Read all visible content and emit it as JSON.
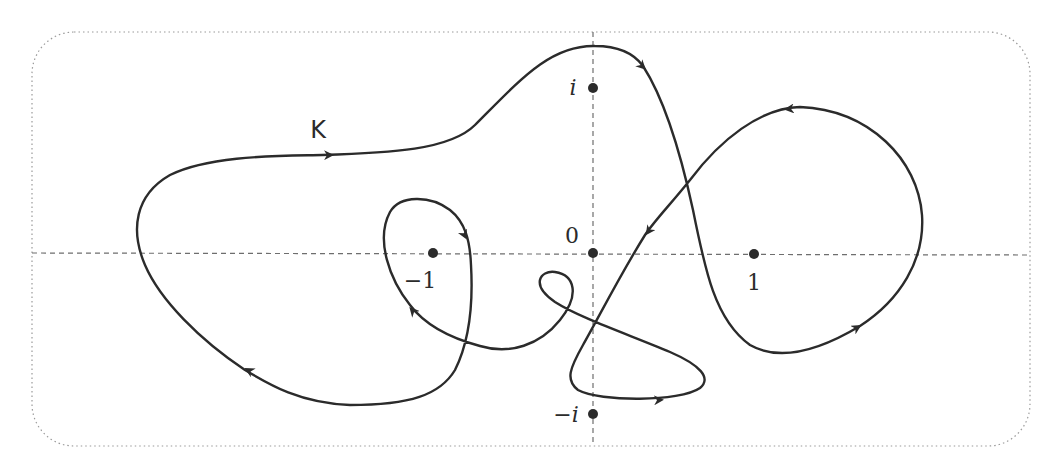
{
  "figure": {
    "curve_label": "K",
    "points": [
      {
        "name": "origin",
        "label": "0",
        "x": 593,
        "y": 253,
        "label_x": 572,
        "label_y": 243
      },
      {
        "name": "minus-one",
        "label": "−1",
        "x": 433,
        "y": 253,
        "label_x": 420,
        "label_y": 288
      },
      {
        "name": "one",
        "label": "1",
        "x": 754,
        "y": 254,
        "label_x": 754,
        "label_y": 290
      },
      {
        "name": "i",
        "label": "i",
        "x": 593,
        "y": 88,
        "label_x": 573,
        "label_y": 95
      },
      {
        "name": "minus-i",
        "label": "−i",
        "x": 593,
        "y": 414,
        "label_x": 566,
        "label_y": 422
      }
    ],
    "axes": {
      "horizontal": {
        "y": 253,
        "x1": 32,
        "x2": 1030
      },
      "vertical": {
        "x": 593,
        "y1": 32,
        "y2": 446
      }
    },
    "border": {
      "x": 32,
      "y": 32,
      "width": 998,
      "height": 414,
      "radius": 42
    },
    "colors": {
      "curve": "#2b2b2b",
      "axes": "#6e6e6e",
      "border": "#9a9a9a",
      "points": "#2b2b2b"
    }
  }
}
